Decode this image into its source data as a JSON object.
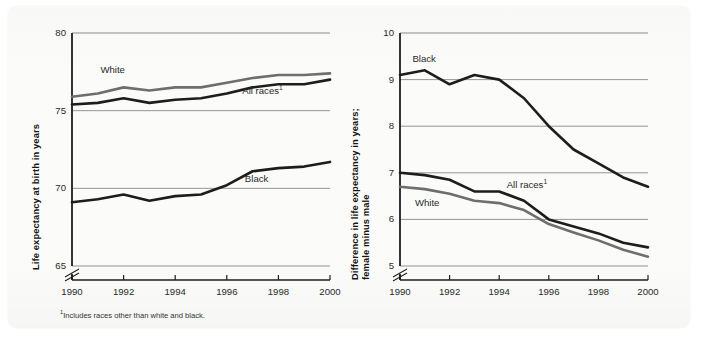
{
  "figure": {
    "footnote": "Includes races other than white and black.",
    "footnote_marker": "1"
  },
  "colors": {
    "dark_line": "#1d1d1d",
    "gray_line": "#6e6e6e",
    "gridline": "#8a8a8a",
    "axis": "#1d1d1d",
    "text": "#2a2a2a",
    "background": "#fbfbfa"
  },
  "chart_data": [
    {
      "type": "line",
      "id": "life-expectancy",
      "title": "",
      "xlabel": "",
      "ylabel": "Life expectancy at birth in years",
      "x": [
        1990,
        1991,
        1992,
        1993,
        1994,
        1995,
        1996,
        1997,
        1998,
        1999,
        2000
      ],
      "xlim": [
        1990,
        2000
      ],
      "ylim": [
        65,
        80
      ],
      "yticks": [
        65,
        70,
        75,
        80
      ],
      "xticks": [
        1990,
        1992,
        1994,
        1996,
        1998,
        2000
      ],
      "xtick_labels": [
        "1990",
        "1992",
        "1994",
        "1996",
        "1998",
        "2000"
      ],
      "ytick_labels": [
        "65",
        "70",
        "75",
        "80"
      ],
      "axis_break": true,
      "grid": true,
      "legend": "inline-labels",
      "series": [
        {
          "name": "White",
          "label": "White",
          "color": "#6e6e6e",
          "label_x": 1991.1,
          "label_y": 77.6,
          "values": [
            75.9,
            76.1,
            76.5,
            76.3,
            76.5,
            76.5,
            76.8,
            77.1,
            77.3,
            77.3,
            77.4
          ]
        },
        {
          "name": "All races",
          "label": "All races",
          "label_marker": "1",
          "color": "#1d1d1d",
          "label_x": 1996.6,
          "label_y": 76.3,
          "values": [
            75.4,
            75.5,
            75.8,
            75.5,
            75.7,
            75.8,
            76.1,
            76.5,
            76.7,
            76.7,
            77.0
          ]
        },
        {
          "name": "Black",
          "label": "Black",
          "color": "#1d1d1d",
          "label_x": 1996.7,
          "label_y": 70.6,
          "values": [
            69.1,
            69.3,
            69.6,
            69.2,
            69.5,
            69.6,
            70.2,
            71.1,
            71.3,
            71.4,
            71.7
          ]
        }
      ]
    },
    {
      "type": "line",
      "id": "female-minus-male-gap",
      "title": "",
      "xlabel": "",
      "ylabel": "Difference in life expectancy in years; female minus male",
      "ylabel_lines": [
        "Difference in life expectancy in years;",
        "female minus male"
      ],
      "x": [
        1990,
        1991,
        1992,
        1993,
        1994,
        1995,
        1996,
        1997,
        1998,
        1999,
        2000
      ],
      "xlim": [
        1990,
        2000
      ],
      "ylim": [
        5,
        10
      ],
      "yticks": [
        5,
        6,
        7,
        8,
        9,
        10
      ],
      "xticks": [
        1990,
        1992,
        1994,
        1996,
        1998,
        2000
      ],
      "xtick_labels": [
        "1990",
        "1992",
        "1994",
        "1996",
        "1998",
        "2000"
      ],
      "ytick_labels": [
        "5",
        "6",
        "7",
        "8",
        "9",
        "10"
      ],
      "axis_break": true,
      "grid": true,
      "legend": "inline-labels",
      "series": [
        {
          "name": "Black",
          "label": "Black",
          "color": "#1d1d1d",
          "label_x": 1990.5,
          "label_y": 9.45,
          "values": [
            9.1,
            9.2,
            8.9,
            9.1,
            9.0,
            8.6,
            8.0,
            7.5,
            7.2,
            6.9,
            6.7
          ]
        },
        {
          "name": "All races",
          "label": "All races",
          "label_marker": "1",
          "color": "#1d1d1d",
          "label_x": 1994.3,
          "label_y": 6.75,
          "values": [
            7.0,
            6.95,
            6.85,
            6.6,
            6.6,
            6.4,
            6.0,
            5.85,
            5.7,
            5.5,
            5.4
          ]
        },
        {
          "name": "White",
          "label": "White",
          "color": "#6e6e6e",
          "label_x": 1990.6,
          "label_y": 6.35,
          "values": [
            6.7,
            6.65,
            6.55,
            6.4,
            6.35,
            6.2,
            5.9,
            5.72,
            5.55,
            5.35,
            5.2
          ]
        }
      ]
    }
  ]
}
